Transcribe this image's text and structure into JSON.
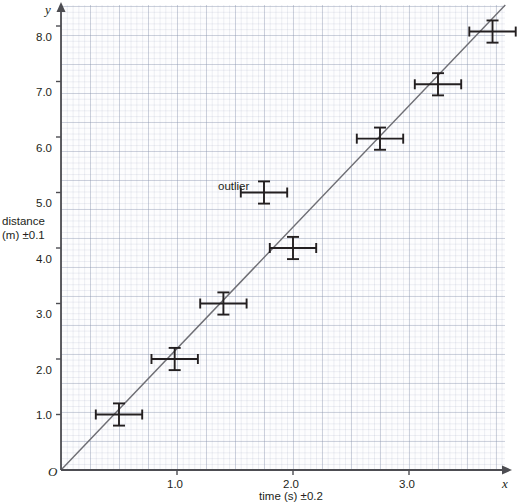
{
  "chart_data": {
    "type": "scatter",
    "title": "",
    "xlabel": "time (s) ±0.2",
    "ylabel_line1": "distance",
    "ylabel_line2": "(m) ±0.1",
    "x_axis_letter": "x",
    "y_axis_letter": "y",
    "origin_label": "O",
    "xlim": [
      0,
      3.93
    ],
    "ylim": [
      0,
      8.38
    ],
    "xticks": [
      1.0,
      2.0,
      3.0
    ],
    "xtick_labels": [
      "1.0",
      "2.0",
      "3.0"
    ],
    "yticks": [
      1.0,
      2.0,
      3.0,
      4.0,
      5.0,
      6.0,
      7.0,
      8.0
    ],
    "ytick_labels": [
      "1.0",
      "2.0",
      "3.0",
      "4.0",
      "5.0",
      "6.0",
      "7.0",
      "8.0"
    ],
    "grid": true,
    "grid_minor_step": 0.05,
    "grid_major_step": 0.25,
    "legend": "none",
    "x_error": 0.2,
    "y_error": 0.1,
    "points": [
      {
        "x": 0.5,
        "y": 1.0
      },
      {
        "x": 0.98,
        "y": 2.0
      },
      {
        "x": 1.4,
        "y": 3.0
      },
      {
        "x": 1.75,
        "y": 5.0,
        "note": "outlier"
      },
      {
        "x": 2.0,
        "y": 4.0
      },
      {
        "x": 2.75,
        "y": 5.97
      },
      {
        "x": 3.25,
        "y": 6.95
      },
      {
        "x": 3.72,
        "y": 7.9
      }
    ],
    "annotations": [
      {
        "text": "outlier",
        "x": 1.43,
        "y": 5.32
      }
    ],
    "trendline": {
      "label": "best-fit line",
      "x_start": 0.0,
      "y_start": 0.0,
      "x_end": 3.83,
      "y_end": 8.38
    },
    "colors": {
      "marker": "#231f20",
      "trendline": "#6e6e74",
      "axis": "#4d4d52",
      "grid_major": "#8c96af",
      "grid_minor": "#96a0b9",
      "background": "#fdfdfe",
      "text": "#231f20"
    }
  }
}
